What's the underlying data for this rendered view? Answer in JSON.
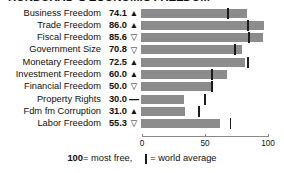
{
  "title": "HONDURAS 'S ECONOMIC FREEDOM",
  "footer": {
    "free_value": "100",
    "free_text": " = most free,",
    "avg_text": " = world average",
    "avg_icon": "vertical-tick-icon"
  },
  "axis": {
    "min": 0,
    "max": 100,
    "ticks": [
      0,
      50,
      100
    ],
    "tick_labels": [
      "0",
      "50",
      "100"
    ]
  },
  "colors": {
    "bar": "#8c8c8c",
    "average_tick": "#1c1c1c",
    "text": "#111111",
    "axis": "#8a8a8a",
    "background": "#ffffff"
  },
  "glyphs": {
    "up": "▲",
    "down": "▽",
    "flat": "—"
  },
  "chart_data": {
    "type": "bar",
    "title": "HONDURAS 'S ECONOMIC FREEDOM",
    "xlabel": "",
    "ylabel": "",
    "xlim": [
      0,
      100
    ],
    "grid": false,
    "orientation": "horizontal",
    "categories": [
      "Business Freedom",
      "Trade Freedom",
      "Fiscal Freedom",
      "Government Size",
      "Monetary Freedom",
      "Investment Freedom",
      "Financial Freedom",
      "Property Rights",
      "Fdm fm Corruption",
      "Labor Freedom"
    ],
    "values": [
      74.1,
      86.0,
      85.6,
      70.8,
      72.5,
      60.0,
      50.0,
      30.0,
      31.0,
      55.3
    ],
    "value_labels": [
      "74.1",
      "86.0",
      "85.6",
      "70.8",
      "72.5",
      "60.0",
      "50.0",
      "30.0",
      "31.0",
      "55.3"
    ],
    "trends": [
      "up",
      "up",
      "down",
      "down",
      "up",
      "up",
      "down",
      "flat",
      "up",
      "down"
    ],
    "world_average": [
      60.0,
      74.0,
      75.0,
      65.0,
      74.0,
      49.0,
      49.0,
      44.0,
      40.0,
      62.0
    ],
    "series": [
      {
        "name": "Score",
        "values": [
          74.1,
          86.0,
          85.6,
          70.8,
          72.5,
          60.0,
          50.0,
          30.0,
          31.0,
          55.3
        ]
      },
      {
        "name": "World average",
        "values": [
          60.0,
          74.0,
          75.0,
          65.0,
          74.0,
          49.0,
          49.0,
          44.0,
          40.0,
          62.0
        ]
      }
    ],
    "rows": [
      {
        "label": "Business Freedom",
        "value": 74.1,
        "value_label": "74.1",
        "trend": "up",
        "world_average": 60.0
      },
      {
        "label": "Trade Freedom",
        "value": 86.0,
        "value_label": "86.0",
        "trend": "up",
        "world_average": 74.0
      },
      {
        "label": "Fiscal Freedom",
        "value": 85.6,
        "value_label": "85.6",
        "trend": "down",
        "world_average": 75.0
      },
      {
        "label": "Government Size",
        "value": 70.8,
        "value_label": "70.8",
        "trend": "down",
        "world_average": 65.0
      },
      {
        "label": "Monetary Freedom",
        "value": 72.5,
        "value_label": "72.5",
        "trend": "up",
        "world_average": 74.0
      },
      {
        "label": "Investment Freedom",
        "value": 60.0,
        "value_label": "60.0",
        "trend": "up",
        "world_average": 49.0
      },
      {
        "label": "Financial Freedom",
        "value": 50.0,
        "value_label": "50.0",
        "trend": "down",
        "world_average": 49.0
      },
      {
        "label": "Property Rights",
        "value": 30.0,
        "value_label": "30.0",
        "trend": "flat",
        "world_average": 44.0
      },
      {
        "label": "Fdm fm Corruption",
        "value": 31.0,
        "value_label": "31.0",
        "trend": "up",
        "world_average": 40.0
      },
      {
        "label": "Labor Freedom",
        "value": 55.3,
        "value_label": "55.3",
        "trend": "down",
        "world_average": 62.0
      }
    ],
    "legend": [
      "100 = most free",
      "| = world average"
    ],
    "legend_position": "bottom"
  }
}
